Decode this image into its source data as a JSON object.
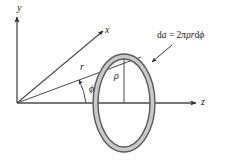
{
  "figure": {
    "kind": "physics-vector-diagram",
    "background_color": "#ffffff",
    "line_color": "#3a3a3a",
    "ring_fill_color": "#c9c9c9",
    "ring_stroke_color": "#555555",
    "width": 228,
    "height": 163
  },
  "axes": [
    {
      "id": "y",
      "label": "y",
      "direction": "up"
    },
    {
      "id": "x",
      "label": "x",
      "direction": "up-right"
    },
    {
      "id": "z",
      "label": "z",
      "direction": "right"
    }
  ],
  "labels": {
    "y_axis": "y",
    "x_axis": "x",
    "z_axis": "z",
    "radius_vector": "r",
    "azimuth_angle": "ϕ",
    "ring_radius": "ρ"
  },
  "annotation": {
    "equation_lhs": "d",
    "equation_lhs_it": "a",
    "equation_eq": " = 2",
    "equation_pi": "π",
    "equation_rho": "ρ",
    "equation_r": "r",
    "equation_d": "d",
    "equation_phi": "ϕ",
    "equation_full": "da = 2πρrdϕ"
  },
  "origin": {
    "x": 17,
    "y": 103
  }
}
